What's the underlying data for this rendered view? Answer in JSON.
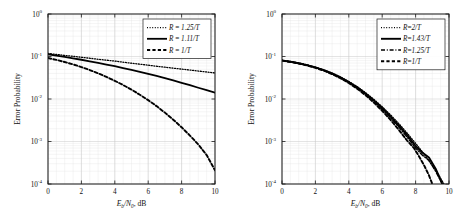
{
  "figure": {
    "title": "",
    "background": "#ffffff",
    "curve_color": "#000000",
    "grid_color": "#c9c9c9"
  },
  "chart_data": [
    {
      "type": "line",
      "panel": "left",
      "title": "",
      "xlabel": "E_b/N_0, dB",
      "xlabel_parts": {
        "main": "E",
        "sub1": "b",
        "slash": "/",
        "main2": "N",
        "sub2": "0",
        "tail": ", dB"
      },
      "ylabel": "Error Probability",
      "xlim": [
        0,
        10
      ],
      "ylim": [
        0.0001,
        1
      ],
      "yscale": "log",
      "xticks": [
        0,
        2,
        4,
        6,
        8,
        10
      ],
      "xticklabels": [
        "0",
        "2",
        "4",
        "6",
        "8",
        "10"
      ],
      "yticks": [
        1,
        0.1,
        0.01,
        0.001,
        0.0001
      ],
      "yticklabels": [
        "10^0",
        "10^-1",
        "10^-2",
        "10^-3",
        "10^-4"
      ],
      "ytick_mantissa": "10",
      "ytick_exponents": [
        "0",
        "-1",
        "-2",
        "-3",
        "-4"
      ],
      "grid": true,
      "grid_minor": true,
      "legend_position": "top-right",
      "series": [
        {
          "name": "R = 1.25/T",
          "label_parts": {
            "lhs": "R",
            "eq": " = ",
            "rhs": "1.25/T"
          },
          "style": "dotted",
          "dasharray": "1,1.6",
          "width": 1.3,
          "x": [
            0,
            0.5,
            1,
            1.5,
            2,
            2.5,
            3,
            3.5,
            4,
            4.5,
            5,
            5.5,
            6,
            6.5,
            7,
            7.5,
            8,
            8.5,
            9,
            9.5,
            10
          ],
          "y": [
            0.118,
            0.112,
            0.106,
            0.101,
            0.096,
            0.091,
            0.086,
            0.082,
            0.078,
            0.0735,
            0.0695,
            0.066,
            0.0625,
            0.059,
            0.056,
            0.0532,
            0.0505,
            0.048,
            0.0455,
            0.0432,
            0.041
          ]
        },
        {
          "name": "R = 1.11/T",
          "label_parts": {
            "lhs": "R",
            "eq": " = ",
            "rhs": "1.11/T"
          },
          "style": "solid",
          "dasharray": "none",
          "width": 1.8,
          "x": [
            0,
            0.5,
            1,
            1.5,
            2,
            2.5,
            3,
            3.5,
            4,
            4.5,
            5,
            5.5,
            6,
            6.5,
            7,
            7.5,
            8,
            8.5,
            9,
            9.5,
            10
          ],
          "y": [
            0.113,
            0.105,
            0.0975,
            0.0905,
            0.0838,
            0.0772,
            0.0708,
            0.0648,
            0.059,
            0.0535,
            0.0484,
            0.0436,
            0.0391,
            0.0348,
            0.0309,
            0.0273,
            0.0241,
            0.0211,
            0.0184,
            0.0161,
            0.0141
          ]
        },
        {
          "name": "R = 1/T",
          "label_parts": {
            "lhs": "R",
            "eq": " = ",
            "rhs": "1/T"
          },
          "style": "dashed",
          "dasharray": "3.2,2.2",
          "width": 1.9,
          "x": [
            0,
            0.5,
            1,
            1.5,
            2,
            2.5,
            3,
            3.5,
            4,
            4.5,
            5,
            5.5,
            6,
            6.5,
            7,
            7.5,
            8,
            8.5,
            9,
            9.5,
            10
          ],
          "y": [
            0.092,
            0.0832,
            0.0742,
            0.0652,
            0.0564,
            0.048,
            0.0402,
            0.0331,
            0.0268,
            0.0213,
            0.0166,
            0.0126,
            0.0094,
            0.0068,
            0.00478,
            0.00326,
            0.00216,
            0.00138,
            0.00085,
            0.00048,
            0.00021
          ]
        }
      ]
    },
    {
      "type": "line",
      "panel": "right",
      "title": "",
      "xlabel": "E_b/N_0, dB",
      "xlabel_parts": {
        "main": "E",
        "sub1": "b",
        "slash": "/",
        "main2": "N",
        "sub2": "0",
        "tail": ", dB"
      },
      "ylabel": "Error Probability",
      "xlim": [
        0,
        10
      ],
      "ylim": [
        0.0001,
        1
      ],
      "yscale": "log",
      "xticks": [
        0,
        2,
        4,
        6,
        8,
        10
      ],
      "xticklabels": [
        "0",
        "2",
        "4",
        "6",
        "8",
        "10"
      ],
      "yticks": [
        1,
        0.1,
        0.01,
        0.001,
        0.0001
      ],
      "yticklabels": [
        "10^0",
        "10^-1",
        "10^-2",
        "10^-3",
        "10^-4"
      ],
      "ytick_mantissa": "10",
      "ytick_exponents": [
        "0",
        "-1",
        "-2",
        "-3",
        "-4"
      ],
      "grid": true,
      "grid_minor": true,
      "legend_position": "top-right",
      "series": [
        {
          "name": "R=2/T",
          "label_parts": {
            "lhs": "R",
            "eq": "=",
            "rhs": "2/T"
          },
          "style": "dotted",
          "dasharray": "1,1.6",
          "width": 1.3,
          "x": [
            0,
            0.5,
            1,
            1.5,
            2,
            2.5,
            3,
            3.5,
            4,
            4.5,
            5,
            5.5,
            6,
            6.5,
            7,
            7.5,
            8,
            8.5,
            9,
            9.3,
            9.7
          ],
          "y": [
            0.082,
            0.0765,
            0.0705,
            0.0638,
            0.0565,
            0.0487,
            0.0408,
            0.0331,
            0.0259,
            0.0195,
            0.0141,
            0.0098,
            0.00655,
            0.00422,
            0.00262,
            0.00157,
            0.00091,
            0.00051,
            0.000275,
            0.000185,
            0.0001
          ]
        },
        {
          "name": "R=1.43/T",
          "label_parts": {
            "lhs": "R",
            "eq": "=",
            "rhs": "1.43/T"
          },
          "style": "solid",
          "dasharray": "none",
          "width": 1.9,
          "x": [
            0,
            0.5,
            1,
            1.5,
            2,
            2.5,
            3,
            3.5,
            4,
            4.5,
            5,
            5.5,
            6,
            6.5,
            7,
            7.5,
            8,
            8.4,
            8.8,
            9.2,
            9.6
          ],
          "y": [
            0.081,
            0.0755,
            0.0695,
            0.0628,
            0.0555,
            0.0478,
            0.0399,
            0.0322,
            0.0251,
            0.0188,
            0.0135,
            0.0093,
            0.00615,
            0.00392,
            0.0024,
            0.00141,
            0.00079,
            0.00055,
            0.00042,
            0.00023,
            0.0001
          ]
        },
        {
          "name": "R=1.25/T",
          "label_parts": {
            "lhs": "R",
            "eq": "=",
            "rhs": "1.25/T"
          },
          "style": "dashdot",
          "dasharray": "4,1.8,1,1.8",
          "width": 1.5,
          "x": [
            0,
            0.5,
            1,
            1.5,
            2,
            2.5,
            3,
            3.5,
            4,
            4.5,
            5,
            5.5,
            6,
            6.5,
            7,
            7.5,
            8,
            8.4,
            8.8,
            9.2,
            9.6
          ],
          "y": [
            0.0805,
            0.075,
            0.069,
            0.0622,
            0.0549,
            0.0472,
            0.0393,
            0.0316,
            0.0245,
            0.0182,
            0.0129,
            0.0088,
            0.00575,
            0.00362,
            0.00218,
            0.00126,
            0.0007,
            0.00048,
            0.00036,
            0.0002,
            0.0001
          ]
        },
        {
          "name": "R=1/T",
          "label_parts": {
            "lhs": "R",
            "eq": "=",
            "rhs": "1/T"
          },
          "style": "dashed",
          "dasharray": "3.2,2.2",
          "width": 1.9,
          "x": [
            0,
            0.5,
            1,
            1.5,
            2,
            2.5,
            3,
            3.5,
            4,
            4.5,
            5,
            5.5,
            6,
            6.5,
            7,
            7.5,
            7.9,
            8.2,
            8.5,
            8.8,
            9.0
          ],
          "y": [
            0.0798,
            0.0742,
            0.0682,
            0.0614,
            0.0541,
            0.0464,
            0.0385,
            0.0308,
            0.0238,
            0.0175,
            0.0123,
            0.00825,
            0.00528,
            0.00322,
            0.00187,
            0.00104,
            0.0007,
            0.00045,
            0.00028,
            0.00016,
            0.0001
          ]
        }
      ]
    }
  ]
}
